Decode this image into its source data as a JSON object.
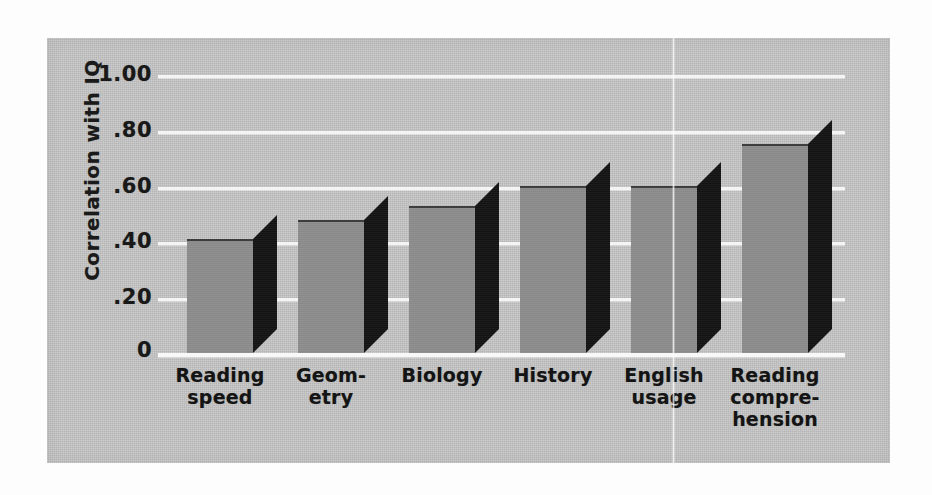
{
  "chart_data": {
    "type": "bar",
    "title": "",
    "subtitle": "",
    "xlabel": "",
    "ylabel": "Correlation with IQ",
    "ylim": [
      0,
      1.0
    ],
    "grid": true,
    "legend": "none",
    "categories": [
      "Reading speed",
      "Geometry",
      "Biology",
      "History",
      "English usage",
      "Reading comprehension"
    ],
    "category_lines": [
      [
        "Reading",
        "speed"
      ],
      [
        "Geom-",
        "etry"
      ],
      [
        "Biology"
      ],
      [
        "History"
      ],
      [
        "English",
        "usage"
      ],
      [
        "Reading",
        "compre-",
        "hension"
      ]
    ],
    "values": [
      0.41,
      0.48,
      0.53,
      0.6,
      0.6,
      0.75
    ],
    "ytick_values": [
      1.0,
      0.8,
      0.6,
      0.4,
      0.2,
      0
    ],
    "ytick_labels": [
      "1.00",
      ".80",
      ".60",
      ".40",
      ".20",
      "0"
    ]
  },
  "style": {
    "panel_background": "#c6c6c6",
    "page_background": "#fdfdfd",
    "bar_face_color": "#8d8d8d",
    "bar_side_color": "#141414",
    "gridline_color": "#f4f4f4",
    "text_color": "#141414"
  }
}
